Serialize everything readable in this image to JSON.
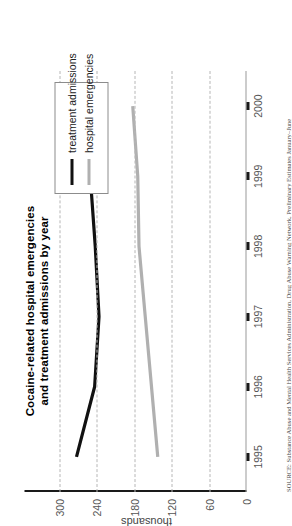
{
  "chart_data": {
    "type": "line",
    "title": "Cocaine-related hospital emergencies and treatment admissions by year",
    "title_line1": "Cocaine-related hospital emergencies",
    "title_line2": "and treatment admissions by year",
    "xlabel": "",
    "ylabel": "thousands",
    "x": [
      "1995",
      "1996",
      "1997",
      "1998",
      "1999",
      "2000"
    ],
    "xlim": [
      1994.6,
      2000.4
    ],
    "ylim": [
      0,
      320
    ],
    "yticks": [
      0,
      60,
      120,
      180,
      240,
      300
    ],
    "ytick_labels": [
      "0",
      "60",
      "120",
      "180",
      "240",
      "300"
    ],
    "grid": "vertical-dashed-at-yticks",
    "legend_position": "upper-right-inside",
    "series": [
      {
        "name": "treatment admissions",
        "color": "#111111",
        "values": [
          272,
          243,
          236,
          242,
          250,
          null
        ]
      },
      {
        "name": "hospital emergencies",
        "color": "#b0b0b0",
        "values": [
          142,
          152,
          162,
          172,
          174,
          182
        ]
      }
    ],
    "source": "SOURCE: Substance Abuse and Mental Health Services Administration, Drug Abuse Warning Network, Preliminary Estimates January–June"
  },
  "legend": {
    "items": [
      {
        "label": "treatment admissions",
        "color": "#111111"
      },
      {
        "label": "hospital emergencies",
        "color": "#b0b0b0"
      }
    ]
  }
}
